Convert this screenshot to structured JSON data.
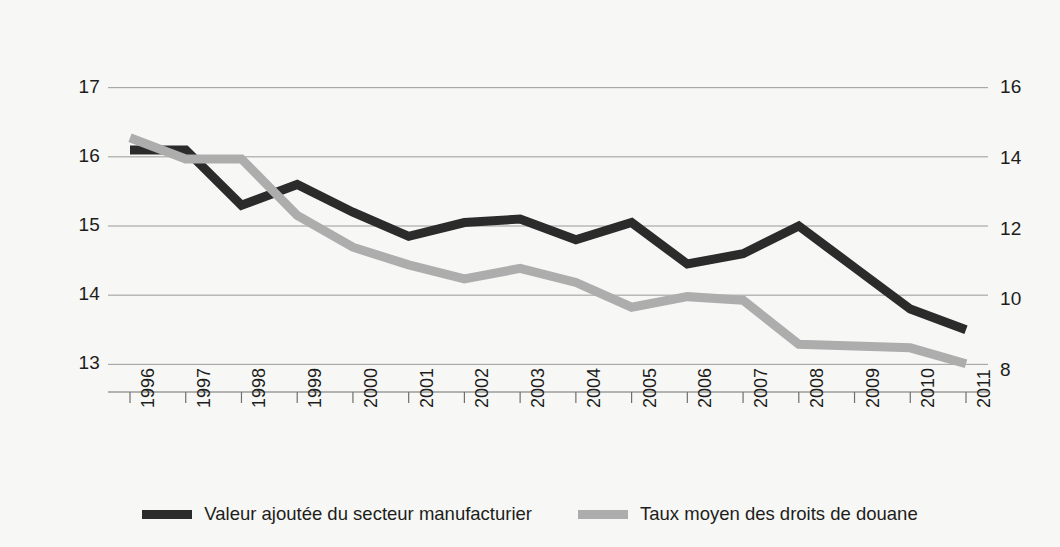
{
  "chart_data": {
    "type": "line",
    "title": "",
    "subtitle": "",
    "xlabel": "",
    "ylabel": "",
    "grid": true,
    "legend_position": "bottom",
    "categories": [
      "1996",
      "1997",
      "1998",
      "1999",
      "2000",
      "2001",
      "2002",
      "2003",
      "2004",
      "2005",
      "2006",
      "2007",
      "2008",
      "2009",
      "2010",
      "2011"
    ],
    "axes": {
      "left": {
        "ticks": [
          13,
          14,
          15,
          16,
          17
        ],
        "ylim": [
          12.6,
          17.4
        ],
        "series_ref": "Valeur ajoutée du secteur manufacturier"
      },
      "right": {
        "ticks": [
          8,
          10,
          12,
          14,
          16
        ],
        "ylim": [
          7.4,
          16.8
        ],
        "series_ref": "Taux moyen des droits de douane"
      }
    },
    "series": [
      {
        "name": "Valeur ajoutée du secteur manufacturier",
        "axis": "left",
        "color": "#2b2b2b",
        "values": [
          16.1,
          16.1,
          15.3,
          15.6,
          15.2,
          14.85,
          15.05,
          15.1,
          14.8,
          15.05,
          14.45,
          14.6,
          15.0,
          14.4,
          13.8,
          13.5
        ]
      },
      {
        "name": "Taux moyen des droits de douane",
        "axis": "right",
        "color": "#adadad",
        "values": [
          14.6,
          14.0,
          14.0,
          12.4,
          11.5,
          11.0,
          10.6,
          10.9,
          10.5,
          9.8,
          10.1,
          10.0,
          8.75,
          8.7,
          8.65,
          8.2
        ]
      }
    ]
  },
  "legend": {
    "items": [
      {
        "label": "Valeur ajoutée du secteur manufacturier",
        "color": "#2b2b2b"
      },
      {
        "label": "Taux moyen des droits de douane",
        "color": "#adadad"
      }
    ]
  },
  "colors": {
    "background": "#f7f7f5",
    "grid": "#9a9a9a",
    "text": "#1d1d1b",
    "series_dark": "#2b2b2b",
    "series_light": "#adadad"
  }
}
